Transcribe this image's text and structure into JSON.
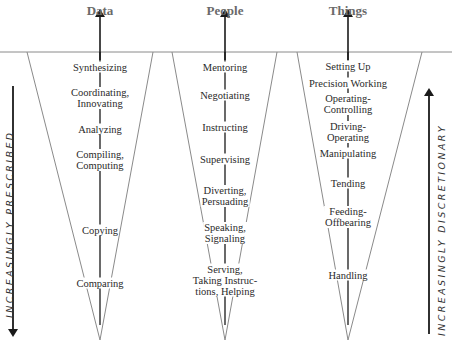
{
  "columns": [
    {
      "title": "Data",
      "center_x": 100,
      "items": [
        {
          "text": "Synthesizing",
          "y": 67
        },
        {
          "text": "Coordinating,\nInnovating",
          "y": 98
        },
        {
          "text": "Analyzing",
          "y": 129
        },
        {
          "text": "Compiling,\nComputing",
          "y": 160
        },
        {
          "text": "Copying",
          "y": 230
        },
        {
          "text": "Comparing",
          "y": 283
        }
      ]
    },
    {
      "title": "People",
      "center_x": 225,
      "items": [
        {
          "text": "Mentoring",
          "y": 67
        },
        {
          "text": "Negotiating",
          "y": 95
        },
        {
          "text": "Instructing",
          "y": 127
        },
        {
          "text": "Supervising",
          "y": 159
        },
        {
          "text": "Diverting,\nPersuading",
          "y": 196
        },
        {
          "text": "Speaking,\nSignaling",
          "y": 233
        },
        {
          "text": "Serving,\nTaking Instruc-\ntions, Helping",
          "y": 280
        }
      ]
    },
    {
      "title": "Things",
      "center_x": 348,
      "items": [
        {
          "text": "Setting Up",
          "y": 66
        },
        {
          "text": "Precision Working",
          "y": 83
        },
        {
          "text": "Operating-\nControlling",
          "y": 104
        },
        {
          "text": "Driving-\nOperating",
          "y": 132
        },
        {
          "text": "Manipulating",
          "y": 153
        },
        {
          "text": "Tending",
          "y": 183
        },
        {
          "text": "Feeding-\nOffbearing",
          "y": 217
        },
        {
          "text": "Handling",
          "y": 275
        }
      ]
    }
  ],
  "side_labels": {
    "left": "INCREASINGLY PRESCRIBED",
    "right": "INCREASINGLY DISCRETIONARY"
  },
  "colors": {
    "line": "#888888",
    "arrow": "#1a1a1a",
    "title": "#6a6a6a",
    "text": "#2a2a2a"
  }
}
